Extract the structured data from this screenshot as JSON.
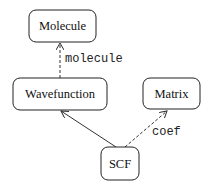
{
  "diagram": {
    "type": "class-dependency-graph",
    "nodes": [
      {
        "id": "molecule",
        "label": "Molecule",
        "x": 29,
        "y": 10,
        "w": 67,
        "h": 32
      },
      {
        "id": "wavefunction",
        "label": "Wavefunction",
        "x": 13,
        "y": 78,
        "w": 94,
        "h": 32
      },
      {
        "id": "matrix",
        "label": "Matrix",
        "x": 143,
        "y": 78,
        "w": 57,
        "h": 31
      },
      {
        "id": "scf",
        "label": "SCF",
        "x": 101,
        "y": 147,
        "w": 38,
        "h": 33
      }
    ],
    "edges": [
      {
        "from": "wavefunction",
        "to": "molecule",
        "style": "dashed",
        "label": "molecule"
      },
      {
        "from": "scf",
        "to": "wavefunction",
        "style": "solid",
        "label": ""
      },
      {
        "from": "scf",
        "to": "matrix",
        "style": "dashed",
        "label": "coef"
      }
    ]
  },
  "colors": {
    "stroke": "#222222",
    "background": "#ffffff",
    "text": "#111111"
  }
}
